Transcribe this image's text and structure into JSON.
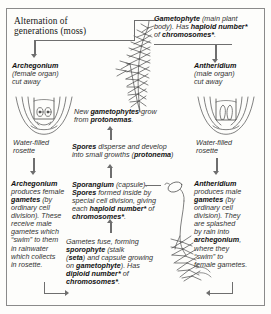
{
  "figure": {
    "title_line1": "Alternation of",
    "title_line2": "generations (moss)"
  },
  "labels": {
    "gametophyte": {
      "name": "Gametophyte",
      "line1_rest": " (main plant",
      "line2_a": "body). Has ",
      "line2_b": "haploid number*",
      "line3_a": "of ",
      "line3_b": "chromosomes*",
      "line3_c": "."
    },
    "archegonium_top": {
      "name": "Archegonium",
      "line2": "(female organ)",
      "line3": "cut away"
    },
    "antheridium_top": {
      "name": "Antheridium",
      "line2": "(male organ)",
      "line3": "cut away"
    },
    "rosette_left": {
      "line1": "Water-filled",
      "line2": "rosette"
    },
    "rosette_right": {
      "line1": "Water-filled",
      "line2": "rosette"
    },
    "new_gametophytes": {
      "line1_a": "New ",
      "line1_b": "gametophytes",
      "line1_c": " grow",
      "line2_a": "from ",
      "line2_b": "protonemas",
      "line2_c": "."
    },
    "spores": {
      "line1_a": "Spores",
      "line1_b": " disperse and develop",
      "line2_a": "into small growths (",
      "line2_b": "protonema",
      "line2_c": ")"
    },
    "archegonium_detail": {
      "l1": "Archegonium",
      "l2": "produces female",
      "l3_a": "gametes",
      "l3_b": " (by",
      "l4": "ordinary cell",
      "l5": "division). These",
      "l6": "receive male",
      "l7": "gametes which",
      "l8": "“swim” to them",
      "l9": "in rainwater",
      "l10": "which collects",
      "l11": "in rosette."
    },
    "sporangium": {
      "l1_a": "Sporangium",
      "l1_b": " (capsule).",
      "l2_a": "Spores",
      "l2_b": " formed inside by",
      "l3": "special cell division, giving",
      "l4_a": "each ",
      "l4_b": "haploid number*",
      "l4_c": " of",
      "l5_a": "chromosomes*",
      "l5_b": "."
    },
    "antheridium_detail": {
      "l1": "Antheridium",
      "l2": "produces male",
      "l3_a": "gametes",
      "l3_b": " (by",
      "l4": "ordinary cell",
      "l5": "division). They",
      "l6": "are splashed",
      "l7": "by rain into",
      "l8_a": "archegonium",
      "l8_b": ",",
      "l9": "where they",
      "l10": "“swim” to",
      "l11": "female gametes."
    },
    "sporophyte": {
      "l1": "Gametes fuse, forming",
      "l2_a": "sporophyte",
      "l2_b": " (stalk",
      "l3_a": "(",
      "l3_b": "seta",
      "l3_c": ") and capsule growing",
      "l4_a": "on ",
      "l4_b": "gametophyte",
      "l4_c": "). Has",
      "l5_a": "diploid number*",
      "l5_b": " of",
      "l6_a": "chromosomes*",
      "l6_b": "."
    }
  },
  "colors": {
    "ink": "#1b1b1b",
    "arrow": "#6e6e6e",
    "paper": "#fdfdfb",
    "rule": "#8a8a8a",
    "art": "#4a4a4a"
  },
  "icons": {
    "arrow_down": "arrow-down-icon",
    "arrow_up": "arrow-up-icon",
    "arrow_left": "arrow-left-icon",
    "arrow_right": "arrow-right-icon"
  }
}
